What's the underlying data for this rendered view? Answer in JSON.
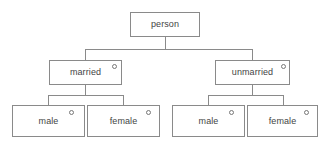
{
  "diagram": {
    "type": "tree",
    "canvas": {
      "width": 329,
      "height": 145,
      "background": "#ffffff"
    },
    "style": {
      "box_border_color": "#8a8a8a",
      "box_fill_color": "#ffffff",
      "text_color": "#444444",
      "connector_color": "#8a8a8a",
      "marker_color": "#777777"
    },
    "nodes": {
      "root": {
        "label": "person",
        "has_marker": false,
        "x": 130,
        "y": 12,
        "w": 70,
        "h": 25
      },
      "married": {
        "label": "married",
        "has_marker": true,
        "marker_symbol": "circle-outline",
        "x": 49,
        "y": 60,
        "w": 73,
        "h": 25
      },
      "unmarried": {
        "label": "unmarried",
        "has_marker": true,
        "marker_symbol": "circle-outline",
        "x": 215,
        "y": 60,
        "w": 75,
        "h": 25
      },
      "married_male": {
        "label": "male",
        "has_marker": true,
        "marker_symbol": "circle-outline",
        "x": 12,
        "y": 105,
        "w": 73,
        "h": 32
      },
      "married_female": {
        "label": "female",
        "has_marker": true,
        "marker_symbol": "circle-outline",
        "x": 87,
        "y": 105,
        "w": 73,
        "h": 32
      },
      "unmarried_male": {
        "label": "male",
        "has_marker": true,
        "marker_symbol": "circle-outline",
        "x": 172,
        "y": 105,
        "w": 73,
        "h": 32
      },
      "unmarried_female": {
        "label": "female",
        "has_marker": true,
        "marker_symbol": "circle-outline",
        "x": 247,
        "y": 105,
        "w": 71,
        "h": 32
      }
    },
    "edges": [
      {
        "from": "root",
        "to": "married"
      },
      {
        "from": "root",
        "to": "unmarried"
      },
      {
        "from": "married",
        "to": "married_male"
      },
      {
        "from": "married",
        "to": "married_female"
      },
      {
        "from": "unmarried",
        "to": "unmarried_male"
      },
      {
        "from": "unmarried",
        "to": "unmarried_female"
      }
    ]
  }
}
